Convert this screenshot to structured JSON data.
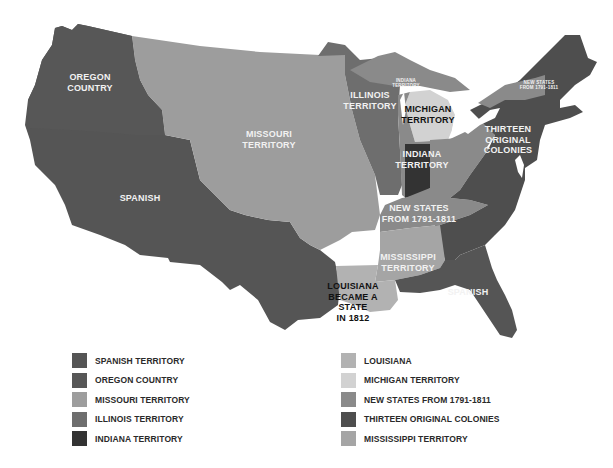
{
  "colors": {
    "spanish": "#555555",
    "oregon": "#575757",
    "missouri": "#9d9d9d",
    "illinois": "#6e6e6e",
    "indiana": "#333333",
    "louisiana": "#b2b2b2",
    "michigan": "#d2d2d2",
    "new_states": "#8a8a8a",
    "thirteen_colonies": "#4e4e4e",
    "mississippi": "#a5a5a5",
    "background": "#ffffff"
  },
  "map_labels": {
    "oregon": "OREGON\nCOUNTRY",
    "missouri": "MISSOURI\nTERRITORY",
    "spanish_west": "SPANISH",
    "illinois": "ILLINOIS\nTERRITORY",
    "indiana_small": "INDIANA\nTERRITORY",
    "michigan": "MICHIGAN\nTERRITORY",
    "new_states_ne": "NEW STATES\nFROM 1791-1811",
    "thirteen": "THIRTEEN\nORIGINAL\nCOLONIES",
    "indiana": "INDIANA\nTERRITORY",
    "new_states": "NEW STATES\nFROM 1791-1811",
    "mississippi": "MISSISSIPPI\nTERRITORY",
    "louisiana": "LOUISIANA\nBECAME A STATE\nIN 1812",
    "spanish_florida": "SPANISH"
  },
  "legend": {
    "left": [
      {
        "label": "SPANISH TERRITORY",
        "color": "#555555"
      },
      {
        "label": "OREGON COUNTRY",
        "color": "#575757"
      },
      {
        "label": "MISSOURI TERRITORY",
        "color": "#9d9d9d"
      },
      {
        "label": "ILLINOIS TERRITORY",
        "color": "#6e6e6e"
      },
      {
        "label": "INDIANA TERRITORY",
        "color": "#333333"
      }
    ],
    "right": [
      {
        "label": "LOUISIANA",
        "color": "#b2b2b2"
      },
      {
        "label": "MICHIGAN TERRITORY",
        "color": "#d2d2d2"
      },
      {
        "label": "NEW STATES FROM 1791-1811",
        "color": "#8a8a8a"
      },
      {
        "label": "THIRTEEN ORIGINAL COLONIES",
        "color": "#4e4e4e"
      },
      {
        "label": "MISSISSIPPI TERRITORY",
        "color": "#a5a5a5"
      }
    ]
  }
}
